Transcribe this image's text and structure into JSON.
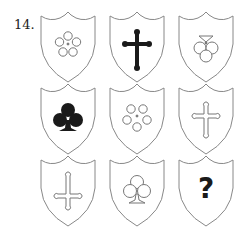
{
  "question": {
    "number": "14."
  },
  "grid": {
    "rows": 3,
    "cols": 3,
    "cells": [
      {
        "row": 1,
        "col": 1,
        "symbol": "flower-five-petal",
        "fill": "outline"
      },
      {
        "row": 1,
        "col": 2,
        "symbol": "cross-botonnee",
        "fill": "solid",
        "orientation": "upright"
      },
      {
        "row": 1,
        "col": 3,
        "symbol": "club-trefoil",
        "fill": "outline",
        "orientation": "inverted"
      },
      {
        "row": 2,
        "col": 1,
        "symbol": "club-trefoil",
        "fill": "solid",
        "orientation": "upright"
      },
      {
        "row": 2,
        "col": 2,
        "symbol": "flower-five-petal",
        "fill": "outline"
      },
      {
        "row": 2,
        "col": 3,
        "symbol": "cross-botonnee",
        "fill": "outline",
        "orientation": "upright"
      },
      {
        "row": 3,
        "col": 1,
        "symbol": "cross-botonnee",
        "fill": "outline",
        "orientation": "inverted"
      },
      {
        "row": 3,
        "col": 2,
        "symbol": "club-trefoil",
        "fill": "outline",
        "orientation": "upright"
      },
      {
        "row": 3,
        "col": 3,
        "symbol": "question-mark",
        "label": "?"
      }
    ]
  },
  "colors": {
    "outline": "#888888",
    "solid": "#1a1a1a",
    "background": "#ffffff"
  }
}
